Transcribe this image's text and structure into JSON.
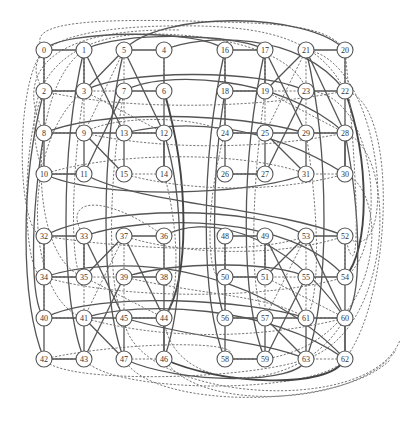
{
  "diagram": {
    "type": "graph",
    "node_count": 64,
    "node_radius": 8,
    "columns_x": [
      44,
      84,
      124,
      164,
      225,
      265,
      306,
      345
    ],
    "rows_y": [
      50,
      91,
      133,
      174,
      236,
      277,
      318,
      359
    ],
    "grid_labels": [
      [
        "0",
        "1",
        "5",
        "4",
        "16",
        "17",
        "21",
        "20"
      ],
      [
        "2",
        "3",
        "7",
        "6",
        "18",
        "19",
        "23",
        "22"
      ],
      [
        "8",
        "9",
        "13",
        "12",
        "24",
        "25",
        "29",
        "28"
      ],
      [
        "10",
        "11",
        "15",
        "14",
        "26",
        "27",
        "31",
        "30"
      ],
      [
        "32",
        "33",
        "37",
        "36",
        "48",
        "49",
        "53",
        "52"
      ],
      [
        "34",
        "35",
        "39",
        "38",
        "50",
        "51",
        "55",
        "54"
      ],
      [
        "40",
        "41",
        "45",
        "44",
        "56",
        "57",
        "61",
        "60"
      ],
      [
        "42",
        "43",
        "47",
        "46",
        "58",
        "59",
        "63",
        "62"
      ]
    ],
    "block_local_edges": {
      "solid": [
        [
          0,
          1
        ],
        [
          0,
          2
        ],
        [
          1,
          3
        ],
        [
          2,
          3
        ],
        [
          4,
          5
        ],
        [
          6,
          7
        ],
        [
          8,
          10
        ],
        [
          9,
          11
        ],
        [
          12,
          14
        ],
        [
          13,
          15
        ],
        [
          10,
          11
        ],
        [
          1,
          13
        ],
        [
          5,
          3
        ],
        [
          7,
          11
        ],
        [
          9,
          15
        ],
        [
          2,
          8
        ],
        [
          5,
          12
        ],
        [
          6,
          14
        ],
        [
          8,
          12
        ],
        [
          4,
          6
        ]
      ],
      "dashed": [
        [
          0,
          2
        ],
        [
          1,
          3
        ],
        [
          5,
          7
        ],
        [
          4,
          6
        ],
        [
          8,
          9
        ],
        [
          12,
          13
        ],
        [
          10,
          11
        ],
        [
          14,
          15
        ],
        [
          2,
          7
        ],
        [
          3,
          12
        ],
        [
          5,
          9
        ],
        [
          7,
          13
        ],
        [
          0,
          8
        ],
        [
          1,
          9
        ]
      ]
    },
    "colors": {
      "edge": "#555555",
      "node_fill": "#ffffff",
      "node_stroke": "#555555",
      "label": "#333333"
    }
  }
}
